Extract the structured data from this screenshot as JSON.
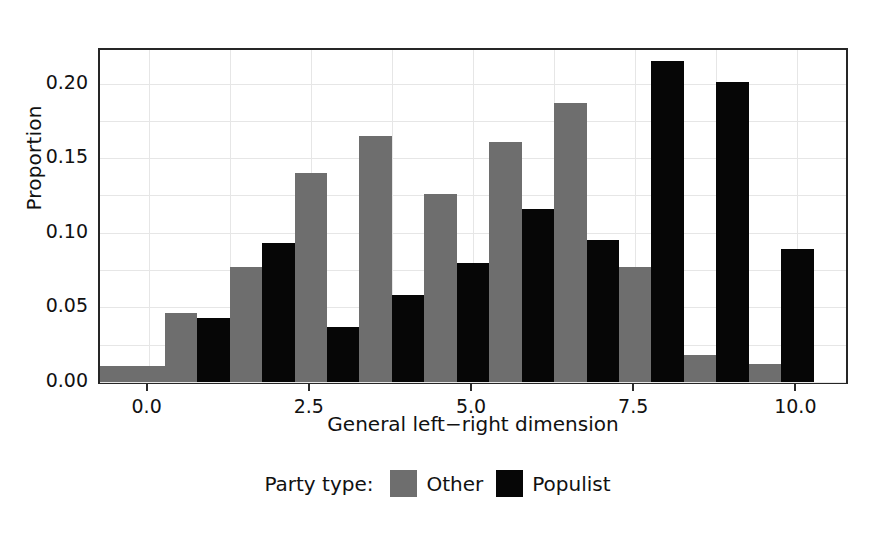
{
  "chart_data": {
    "type": "bar",
    "title": "",
    "xlabel": "General left−right dimension",
    "ylabel": "Proportion",
    "xlim": [
      -0.75,
      10.75
    ],
    "ylim": [
      0.0,
      0.2225
    ],
    "grid": true,
    "legend_position": "bottom",
    "legend_title": "Party type:",
    "xticks": [
      {
        "value": 0.0,
        "label": "0.0"
      },
      {
        "value": 2.5,
        "label": "2.5"
      },
      {
        "value": 5.0,
        "label": "5.0"
      },
      {
        "value": 7.5,
        "label": "7.5"
      },
      {
        "value": 10.0,
        "label": "10.0"
      }
    ],
    "yticks": [
      {
        "value": 0.0,
        "label": "0.00"
      },
      {
        "value": 0.05,
        "label": "0.05"
      },
      {
        "value": 0.1,
        "label": "0.10"
      },
      {
        "value": 0.15,
        "label": "0.15"
      },
      {
        "value": 0.2,
        "label": "0.20"
      }
    ],
    "series": [
      {
        "name": "Other",
        "color": "#6e6e6e",
        "bars": [
          {
            "x0": -0.75,
            "x1": 0.25,
            "value": 0.011
          },
          {
            "x0": 0.25,
            "x1": 0.75,
            "value": 0.046
          },
          {
            "x0": 1.25,
            "x1": 1.75,
            "value": 0.077
          },
          {
            "x0": 2.25,
            "x1": 2.75,
            "value": 0.14
          },
          {
            "x0": 3.25,
            "x1": 3.75,
            "value": 0.165
          },
          {
            "x0": 4.25,
            "x1": 4.75,
            "value": 0.126
          },
          {
            "x0": 5.25,
            "x1": 5.75,
            "value": 0.161
          },
          {
            "x0": 6.25,
            "x1": 6.75,
            "value": 0.187
          },
          {
            "x0": 7.25,
            "x1": 7.75,
            "value": 0.077
          },
          {
            "x0": 8.25,
            "x1": 8.75,
            "value": 0.018
          },
          {
            "x0": 9.25,
            "x1": 9.75,
            "value": 0.012
          }
        ]
      },
      {
        "name": "Populist",
        "color": "#060606",
        "bars": [
          {
            "x0": 0.75,
            "x1": 1.25,
            "value": 0.043
          },
          {
            "x0": 1.75,
            "x1": 2.25,
            "value": 0.093
          },
          {
            "x0": 2.75,
            "x1": 3.25,
            "value": 0.037
          },
          {
            "x0": 3.75,
            "x1": 4.25,
            "value": 0.058
          },
          {
            "x0": 4.75,
            "x1": 5.25,
            "value": 0.08
          },
          {
            "x0": 5.75,
            "x1": 6.25,
            "value": 0.116
          },
          {
            "x0": 6.75,
            "x1": 7.25,
            "value": 0.095
          },
          {
            "x0": 7.75,
            "x1": 8.25,
            "value": 0.215
          },
          {
            "x0": 8.75,
            "x1": 9.25,
            "value": 0.201
          },
          {
            "x0": 9.75,
            "x1": 10.25,
            "value": 0.089
          }
        ]
      }
    ],
    "gridlines_y": [
      0.0,
      0.025,
      0.05,
      0.075,
      0.1,
      0.125,
      0.15,
      0.175,
      0.2
    ],
    "gridlines_x": [
      0.0,
      1.25,
      2.5,
      3.75,
      5.0,
      6.25,
      7.5,
      8.75,
      10.0
    ]
  },
  "legend": {
    "title": "Party type:",
    "items": [
      {
        "label": "Other",
        "swatch": "other"
      },
      {
        "label": "Populist",
        "swatch": "populist"
      }
    ]
  },
  "axes": {
    "ylabel": "Proportion",
    "xlabel": "General left−right dimension"
  }
}
